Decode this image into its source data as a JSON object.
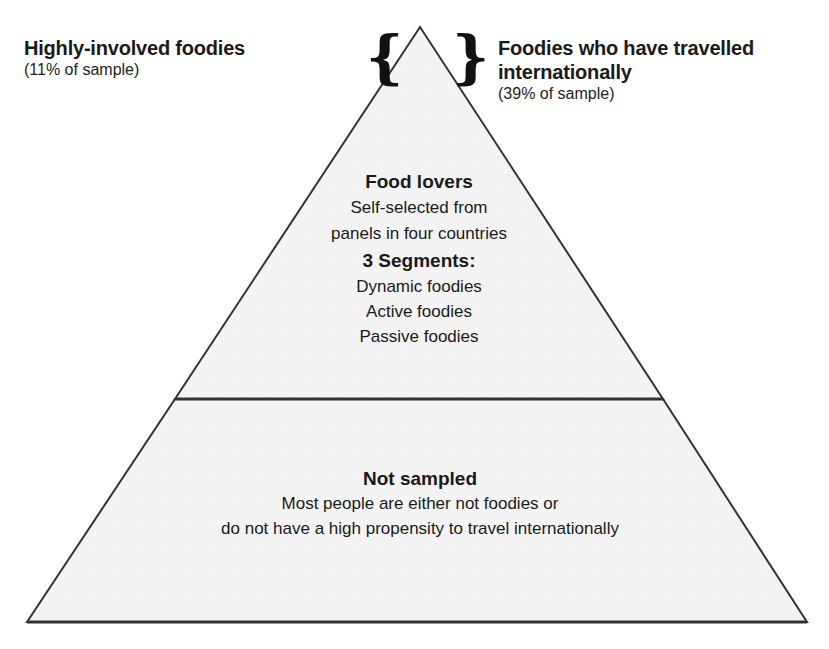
{
  "figure": {
    "type": "pyramid",
    "colors": {
      "outline": "#333333",
      "fill": "#f3f3f3",
      "background": "#ffffff",
      "text": "#1a1a1a"
    }
  },
  "left_label": {
    "title": "Highly-involved foodies",
    "subtitle": "(11% of sample)"
  },
  "right_label": {
    "title_line1": "Foodies who have travelled",
    "title_line2": "internationally",
    "subtitle": "(39% of sample)"
  },
  "braces": {
    "left": "{",
    "right": "}"
  },
  "top_tier": {
    "heading": "Food lovers",
    "desc_line1": "Self-selected from",
    "desc_line2": "panels in four countries",
    "segments_heading": "3 Segments:",
    "segments": [
      "Dynamic foodies",
      "Active foodies",
      "Passive foodies"
    ]
  },
  "bottom_tier": {
    "heading": "Not sampled",
    "desc_line1": "Most people are either not foodies or",
    "desc_line2": "do not have a high propensity to travel internationally"
  }
}
